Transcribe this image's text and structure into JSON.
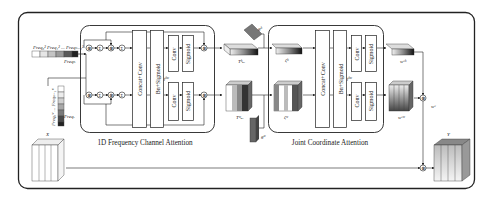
{
  "diagram": {
    "modules": {
      "left": {
        "title": "1D Frequency  Channel Attention"
      },
      "right": {
        "title": "Joint Coordinate Attention"
      }
    },
    "blocks": {
      "left_concat": "Concat+Conv",
      "left_bn": "Bn+Sigmoid",
      "left_conv_top": "Conv",
      "left_sig_top": "Sigmoid",
      "left_conv_bot": "Conv",
      "left_sig_bot": "Sigmoid",
      "right_concat": "Concat+Conv",
      "right_bn": "Bn+Sigmoid",
      "right_conv_top": "Conv",
      "right_sig_top": "Sigmoid",
      "right_conv_bot": "Conv",
      "right_sig_bot": "Sigmoid"
    },
    "labels": {
      "freq_row_top": "Freq₀²  Freq₁²  ...  Freqₙ₋₁²",
      "freq_row_top_sub": "Freqₕ",
      "freq_col": "Freq₀ʷ ... Freqₙ₋₁ʷ",
      "freq_col_sub": "Freqᵥ",
      "input_x": "X",
      "output_y": "Y",
      "t_h": "Tʰₐₓ",
      "t_w": "Tʷₐₓ",
      "g_h": "gʰ",
      "g_w": "gʷ",
      "c_h": "ζʰ",
      "c_w": "ζʷ",
      "w_h": "wᶜʰ",
      "w_w": "wᶜʷ",
      "w_c": "wᶜ",
      "fmid_left": "fʰʷ",
      "fmid_right": "fʰʷ"
    },
    "operators": {
      "multiply": "⊗",
      "add": "⊕",
      "sum": "Σ"
    },
    "colors": {
      "line": "#222222",
      "block_fill": "#ffffff",
      "dark": "#1a1a1a",
      "mid": "#7a7a7a",
      "light": "#d8d8d8"
    }
  }
}
